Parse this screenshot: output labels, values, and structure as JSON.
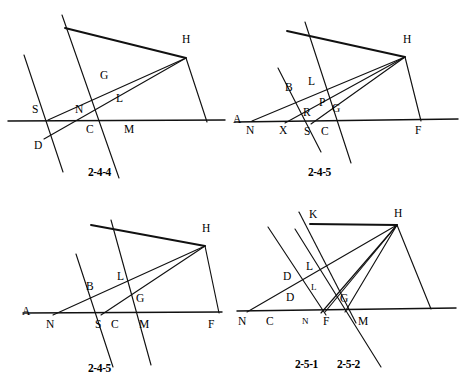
{
  "page": {
    "width": 465,
    "height": 390,
    "background": "#ffffff",
    "ink": "#111111"
  },
  "figures": [
    {
      "id": "2-4-4",
      "caption": "2-4-4",
      "points": [
        {
          "name": "H",
          "label": "H",
          "x": 186,
          "y": 48
        },
        {
          "name": "G",
          "label": "G",
          "x": 104,
          "y": 78
        },
        {
          "name": "L",
          "label": "L",
          "x": 119,
          "y": 101
        },
        {
          "name": "S",
          "label": "S",
          "x": 36,
          "y": 112
        },
        {
          "name": "N",
          "label": "N",
          "x": 79,
          "y": 112
        },
        {
          "name": "C",
          "label": "C",
          "x": 90,
          "y": 127
        },
        {
          "name": "M",
          "label": "M",
          "x": 128,
          "y": 127
        },
        {
          "name": "D",
          "label": "D",
          "x": 38,
          "y": 143
        }
      ]
    },
    {
      "id": "2-4-5-top",
      "caption": "2-4-5",
      "points": [
        {
          "name": "H",
          "label": "H",
          "x": 173,
          "y": 48
        },
        {
          "name": "L",
          "label": "L",
          "x": 78,
          "y": 84
        },
        {
          "name": "B",
          "label": "B",
          "x": 56,
          "y": 90
        },
        {
          "name": "P",
          "label": "P",
          "x": 89,
          "y": 104
        },
        {
          "name": "G",
          "label": "G",
          "x": 102,
          "y": 110
        },
        {
          "name": "R",
          "label": "R",
          "x": 74,
          "y": 114
        },
        {
          "name": "A",
          "label": "A",
          "x": 1,
          "y": 122
        },
        {
          "name": "N",
          "label": "N",
          "x": 16,
          "y": 128
        },
        {
          "name": "X",
          "label": "X",
          "x": 49,
          "y": 128
        },
        {
          "name": "S",
          "label": "S",
          "x": 74,
          "y": 129
        },
        {
          "name": "C",
          "label": "C",
          "x": 91,
          "y": 129
        },
        {
          "name": "F",
          "label": "F",
          "x": 185,
          "y": 128
        }
      ]
    },
    {
      "id": "2-4-5-bottom",
      "caption": "2-4-5",
      "points": [
        {
          "name": "H",
          "label": "H",
          "x": 205,
          "y": 41
        },
        {
          "name": "L",
          "label": "L",
          "x": 120,
          "y": 84
        },
        {
          "name": "B",
          "label": "B",
          "x": 90,
          "y": 94
        },
        {
          "name": "G",
          "label": "G",
          "x": 139,
          "y": 106
        },
        {
          "name": "A",
          "label": "A",
          "x": 26,
          "y": 119
        },
        {
          "name": "N",
          "label": "N",
          "x": 49,
          "y": 127
        },
        {
          "name": "S",
          "label": "S",
          "x": 98,
          "y": 127
        },
        {
          "name": "C",
          "label": "C",
          "x": 114,
          "y": 127
        },
        {
          "name": "M",
          "label": "M",
          "x": 143,
          "y": 127
        },
        {
          "name": "F",
          "label": "F",
          "x": 211,
          "y": 127
        }
      ]
    },
    {
      "id": "2-5-1",
      "caption_left": "2-5-1",
      "caption_right": "2-5-2",
      "points": [
        {
          "name": "K",
          "label": "K",
          "x": 79,
          "y": 21
        },
        {
          "name": "H",
          "label": "H",
          "x": 164,
          "y": 20
        },
        {
          "name": "L-upper",
          "label": "L",
          "x": 76,
          "y": 73
        },
        {
          "name": "D-upper",
          "label": "D",
          "x": 54,
          "y": 83
        },
        {
          "name": "L-lower",
          "label": "L",
          "x": 80,
          "y": 93
        },
        {
          "name": "D-lower",
          "label": "D",
          "x": 57,
          "y": 104
        },
        {
          "name": "G",
          "label": "G",
          "x": 110,
          "y": 105
        },
        {
          "name": "N-left",
          "label": "N",
          "x": 8,
          "y": 124
        },
        {
          "name": "C",
          "label": "C",
          "x": 36,
          "y": 124
        },
        {
          "name": "N-mid",
          "label": "N",
          "x": 70,
          "y": 124
        },
        {
          "name": "F",
          "label": "F",
          "x": 93,
          "y": 124
        },
        {
          "name": "M",
          "label": "M",
          "x": 128,
          "y": 124
        }
      ]
    }
  ],
  "geometry": {
    "fig244": {
      "baseline": [
        8,
        121,
        225,
        120
      ],
      "steep_line": [
        62,
        15,
        119,
        178
      ],
      "short_steep_line": [
        24,
        55,
        63,
        172
      ],
      "ray_S_to_H": [
        48,
        120,
        186,
        58
      ],
      "ray_D_to_H": [
        44,
        139,
        186,
        58
      ],
      "top_bar": [
        65,
        28,
        186,
        58
      ],
      "right_leg": [
        186,
        58,
        207,
        122
      ]
    },
    "fig245a": {
      "baseline": [
        2,
        122,
        225,
        119
      ],
      "steep_line_1": [
        45,
        68,
        88,
        152
      ],
      "steep_line_2": [
        72,
        22,
        118,
        163
      ],
      "ray_N_to_H": [
        19,
        121,
        172,
        57
      ],
      "ray_X_to_H": [
        52,
        123,
        172,
        57
      ],
      "ray_S_to_H": [
        78,
        124,
        172,
        57
      ],
      "top_bar": [
        54,
        31,
        172,
        57
      ],
      "right_leg": [
        172,
        57,
        188,
        121
      ]
    },
    "fig245b": {
      "baseline": [
        23,
        118,
        222,
        117
      ],
      "steep_line_1": [
        76,
        59,
        113,
        172
      ],
      "steep_line_2": [
        111,
        25,
        151,
        170
      ],
      "ray_N_to_H": [
        53,
        120,
        205,
        51
      ],
      "ray_S_to_H": [
        101,
        120,
        205,
        51
      ],
      "top_bar": [
        91,
        30,
        205,
        51
      ],
      "right_leg": [
        205,
        51,
        219,
        118
      ]
    },
    "fig251": {
      "baseline": [
        4,
        116,
        223,
        113
      ],
      "steep_line_1": [
        35,
        32,
        93,
        120
      ],
      "steep_line_2": [
        66,
        17,
        123,
        128
      ],
      "oblique_long": [
        62,
        34,
        148,
        172
      ],
      "ray_N_to_H": [
        14,
        117,
        164,
        30
      ],
      "ray_F_to_H": [
        88,
        118,
        164,
        30
      ],
      "ray_F2_to_H": [
        92,
        117,
        164,
        30
      ],
      "ray_M_to_H": [
        112,
        117,
        164,
        30
      ],
      "top_bar": [
        77,
        29,
        164,
        30
      ],
      "right_leg": [
        164,
        30,
        198,
        114
      ]
    }
  }
}
